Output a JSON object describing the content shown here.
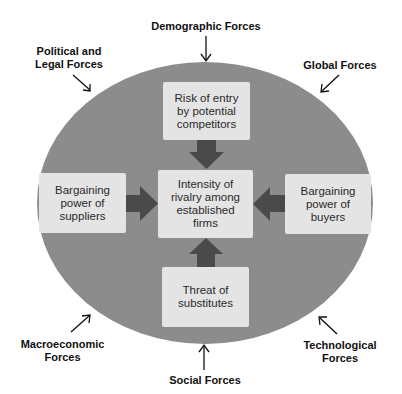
{
  "diagram": {
    "colors": {
      "ellipse": "#8c8c8c",
      "box": "#e4e4e4",
      "arrow_block": "#4a4a4a",
      "text": "#111111"
    },
    "boxes": {
      "top": "Risk of entry\nby potential\ncompetitors",
      "center": "Intensity of\nrivalry among\nestablished\nfirms",
      "left": "Bargaining\npower of\nsuppliers",
      "right": "Bargaining\npower of\nbuyers",
      "bottom": "Threat of\nsubstitutes"
    },
    "external_forces": {
      "top": "Demographic Forces",
      "top_left": "Political and\nLegal Forces",
      "top_right": "Global Forces",
      "bottom_left": "Macroeconomic\nForces",
      "bottom_right": "Technological\nForces",
      "bottom": "Social Forces"
    }
  }
}
